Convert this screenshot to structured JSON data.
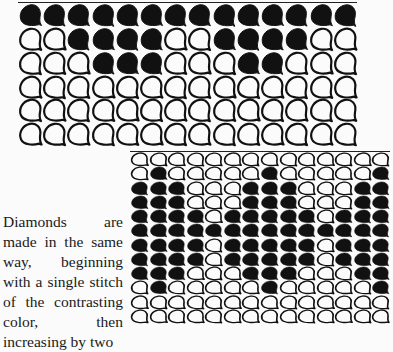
{
  "caption": {
    "lines": [
      "Diamonds are",
      "made in the same",
      "way, beginning",
      "with a single stitch",
      "of the contrasting",
      "color, then",
      "increasing by two"
    ]
  },
  "colors": {
    "ink": "#111111",
    "paper": "#fbfbfb"
  },
  "chart_top": {
    "description": "Knitting stitch chart, 14 columns x 6 rows; 1 = contrasting (filled) stitch, 0 = plain stitch",
    "rows": [
      [
        1,
        1,
        1,
        1,
        1,
        1,
        1,
        1,
        1,
        1,
        1,
        1,
        1,
        1
      ],
      [
        0,
        0,
        1,
        1,
        1,
        1,
        0,
        0,
        1,
        1,
        1,
        1,
        0,
        0
      ],
      [
        0,
        0,
        0,
        1,
        1,
        1,
        0,
        0,
        0,
        1,
        1,
        0,
        0,
        0
      ],
      [
        0,
        0,
        0,
        0,
        0,
        0,
        0,
        0,
        0,
        0,
        0,
        0,
        0,
        0
      ],
      [
        0,
        0,
        0,
        0,
        0,
        0,
        0,
        0,
        0,
        0,
        0,
        0,
        0,
        0
      ],
      [
        0,
        0,
        0,
        0,
        0,
        0,
        0,
        0,
        0,
        0,
        0,
        0,
        0,
        0
      ]
    ]
  },
  "chart_bottom": {
    "description": "Knitting stitch chart with diamond motifs, 14 columns x 12 rows",
    "rows": [
      [
        0,
        0,
        0,
        0,
        0,
        0,
        0,
        0,
        0,
        0,
        0,
        0,
        0,
        0
      ],
      [
        0,
        1,
        0,
        0,
        0,
        0,
        0,
        1,
        0,
        0,
        0,
        0,
        0,
        1
      ],
      [
        1,
        1,
        1,
        0,
        0,
        0,
        1,
        1,
        1,
        0,
        0,
        0,
        1,
        1
      ],
      [
        1,
        1,
        1,
        0,
        0,
        0,
        1,
        1,
        1,
        0,
        0,
        0,
        1,
        1
      ],
      [
        1,
        1,
        1,
        1,
        0,
        1,
        1,
        1,
        1,
        1,
        0,
        1,
        1,
        1
      ],
      [
        1,
        1,
        1,
        1,
        1,
        1,
        1,
        1,
        1,
        1,
        1,
        1,
        1,
        1
      ],
      [
        1,
        1,
        1,
        1,
        0,
        1,
        1,
        1,
        1,
        1,
        0,
        1,
        1,
        1
      ],
      [
        1,
        1,
        1,
        1,
        0,
        1,
        1,
        1,
        1,
        1,
        0,
        1,
        1,
        1
      ],
      [
        1,
        1,
        1,
        0,
        0,
        0,
        1,
        1,
        1,
        0,
        0,
        0,
        1,
        1
      ],
      [
        0,
        1,
        0,
        0,
        0,
        0,
        0,
        1,
        0,
        0,
        0,
        0,
        0,
        1
      ],
      [
        0,
        0,
        0,
        0,
        0,
        0,
        0,
        0,
        0,
        0,
        0,
        0,
        0,
        0
      ],
      [
        0,
        0,
        0,
        0,
        0,
        0,
        0,
        0,
        0,
        0,
        0,
        0,
        0,
        0
      ]
    ]
  }
}
